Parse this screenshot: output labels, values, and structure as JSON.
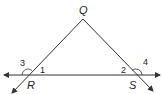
{
  "diagram": {
    "type": "triangle-exterior-angles",
    "line_color": "#333333",
    "points": {
      "Q": "Q",
      "R": "R",
      "S": "S"
    },
    "angles": {
      "a1": "1",
      "a2": "2",
      "a3": "3",
      "a4": "4"
    }
  }
}
